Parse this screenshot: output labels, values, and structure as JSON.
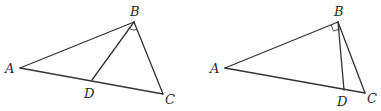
{
  "figures": [
    {
      "id": "left",
      "description": "Triangle ABC with segment BD to side AC; angle marked at B between BD and BC",
      "points": {
        "A": {
          "label": "A",
          "x": 20,
          "y": 68,
          "lx": 5,
          "ly": 73
        },
        "B": {
          "label": "B",
          "x": 134,
          "y": 22,
          "lx": 131,
          "ly": 16
        },
        "C": {
          "label": "C",
          "x": 163,
          "y": 94,
          "lx": 165,
          "ly": 104
        },
        "D": {
          "label": "D",
          "x": 92,
          "y": 80,
          "lx": 84,
          "ly": 98
        }
      },
      "segments": [
        [
          "A",
          "B"
        ],
        [
          "B",
          "C"
        ],
        [
          "A",
          "C"
        ],
        [
          "B",
          "D"
        ]
      ],
      "angle_mark": "angle DBC (arc)"
    },
    {
      "id": "right",
      "description": "Triangle ABC with right angle at B; BD drawn to AC",
      "points": {
        "A": {
          "label": "A",
          "x": 225,
          "y": 68,
          "lx": 210,
          "ly": 73
        },
        "B": {
          "label": "B",
          "x": 338,
          "y": 22,
          "lx": 334,
          "ly": 16
        },
        "C": {
          "label": "C",
          "x": 365,
          "y": 93,
          "lx": 367,
          "ly": 103
        },
        "D": {
          "label": "D",
          "x": 344,
          "y": 90,
          "lx": 338,
          "ly": 106
        }
      },
      "segments": [
        [
          "A",
          "B"
        ],
        [
          "B",
          "C"
        ],
        [
          "A",
          "C"
        ],
        [
          "B",
          "D"
        ]
      ],
      "angle_mark": "right angle ABC (square)"
    }
  ],
  "labels": {
    "left": {
      "A": "A",
      "B": "B",
      "C": "C",
      "D": "D"
    },
    "right": {
      "A": "A",
      "B": "B",
      "C": "C",
      "D": "D"
    }
  }
}
